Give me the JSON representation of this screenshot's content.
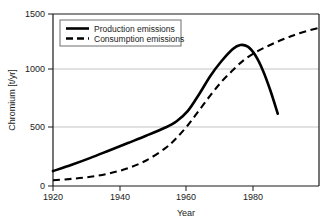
{
  "chart_data": {
    "type": "line",
    "title": "",
    "xlabel": "Year",
    "ylabel": "Chromium [t/yr]",
    "xlim": [
      1920,
      1991
    ],
    "ylim": [
      0,
      1500
    ],
    "xticks": [
      1920,
      1940,
      1960,
      1980
    ],
    "yticks": [
      0,
      500,
      1000,
      1500
    ],
    "xtick_labels": [
      "1920",
      "1940",
      "1960",
      "1980"
    ],
    "ytick_labels": [
      "0",
      "500",
      "1000",
      "1500"
    ],
    "grid": "horizontal",
    "legend_position": "top-left",
    "series": [
      {
        "name": "Production emissions",
        "style": "solid",
        "color": "#000000",
        "x": [
          1920,
          1925,
          1930,
          1935,
          1940,
          1945,
          1950,
          1953,
          1956,
          1959,
          1962,
          1965,
          1968,
          1970,
          1972,
          1974,
          1976,
          1978,
          1980
        ],
        "values": [
          130,
          185,
          245,
          310,
          375,
          440,
          510,
          565,
          655,
          800,
          960,
          1090,
          1195,
          1230,
          1215,
          1140,
          1010,
          835,
          630
        ]
      },
      {
        "name": "Consumption emissions",
        "style": "dashed",
        "color": "#000000",
        "x": [
          1920,
          1925,
          1930,
          1935,
          1940,
          1945,
          1950,
          1953,
          1956,
          1959,
          1962,
          1965,
          1968,
          1971,
          1974,
          1977,
          1980,
          1983,
          1986,
          1991
        ],
        "values": [
          50,
          62,
          80,
          110,
          155,
          225,
          330,
          420,
          530,
          660,
          790,
          910,
          1010,
          1100,
          1165,
          1215,
          1260,
          1300,
          1335,
          1380
        ]
      }
    ]
  },
  "legend": {
    "items": [
      {
        "label": "Production emissions",
        "style": "solid"
      },
      {
        "label": "Consumption emissions",
        "style": "dashed"
      }
    ]
  },
  "colors": {
    "line": "#000000",
    "grid": "#b4b4b4",
    "axis": "#1a1a1a",
    "background": "#ffffff"
  }
}
